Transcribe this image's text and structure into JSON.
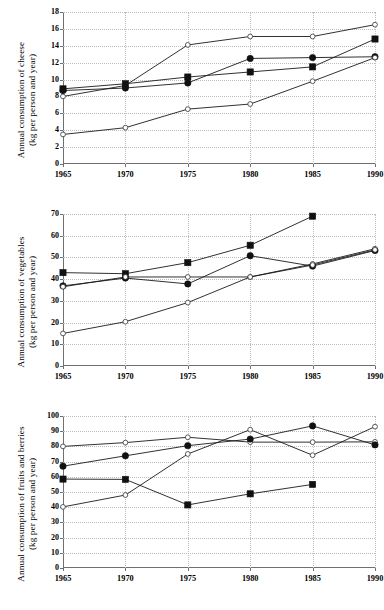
{
  "figure": {
    "panel_count": 3
  },
  "chart_data": [
    {
      "type": "line",
      "title": "",
      "ylabel": "Annual consumption of cheese\n(kg per person and year)",
      "xlabel": "",
      "x": [
        1965,
        1970,
        1975,
        1980,
        1985,
        1990
      ],
      "xticklabels": [
        "1965",
        "1970",
        "1975",
        "1980",
        "1985",
        "1990"
      ],
      "yticklabels": [
        "0",
        "2",
        "4",
        "6",
        "8",
        "10",
        "12",
        "14",
        "16",
        "18"
      ],
      "ylim": [
        0,
        18
      ],
      "ytick_step": 2,
      "xlim": [
        1965,
        1990
      ],
      "grid": true,
      "legend": "none",
      "series": [
        {
          "name": "series-open-circle-high",
          "marker": "open-circle",
          "values": [
            8.0,
            9.3,
            14.1,
            15.1,
            15.1,
            16.5
          ]
        },
        {
          "name": "series-filled-square",
          "marker": "filled-square",
          "values": [
            8.9,
            9.5,
            10.3,
            10.9,
            11.5,
            14.8
          ]
        },
        {
          "name": "series-filled-circle",
          "marker": "filled-circle",
          "values": [
            8.7,
            9.0,
            9.6,
            12.5,
            12.6,
            12.7
          ]
        },
        {
          "name": "series-open-circle-low",
          "marker": "open-circle",
          "values": [
            3.5,
            4.3,
            6.5,
            7.1,
            9.8,
            12.6
          ]
        }
      ]
    },
    {
      "type": "line",
      "title": "",
      "ylabel": "Annual consumption of vegetables\n(kg per person and year)",
      "xlabel": "",
      "x": [
        1965,
        1970,
        1975,
        1980,
        1985,
        1990
      ],
      "xticklabels": [
        "1965",
        "1970",
        "1975",
        "1980",
        "1985",
        "1990"
      ],
      "yticklabels": [
        "0",
        "10",
        "20",
        "30",
        "40",
        "50",
        "60",
        "70"
      ],
      "ylim": [
        0,
        70
      ],
      "ytick_step": 10,
      "xlim": [
        1965,
        1990
      ],
      "grid": true,
      "legend": "none",
      "series": [
        {
          "name": "series-filled-square",
          "marker": "filled-square",
          "values": [
            43.0,
            42.5,
            47.6,
            55.6,
            69.0,
            null
          ]
        },
        {
          "name": "series-filled-circle",
          "marker": "filled-circle",
          "values": [
            36.9,
            40.5,
            37.8,
            50.8,
            46.0,
            53.2
          ]
        },
        {
          "name": "series-open-circle-flat",
          "marker": "open-circle",
          "values": [
            36.5,
            41.0,
            41.0,
            41.0,
            47.0,
            54.0
          ]
        },
        {
          "name": "series-open-circle-low",
          "marker": "open-circle",
          "values": [
            15.0,
            20.4,
            29.2,
            41.0,
            46.5,
            53.5
          ]
        }
      ]
    },
    {
      "type": "line",
      "title": "",
      "ylabel": "Annual consumption of fruits and berries\n(kg per person and year)",
      "xlabel": "",
      "x": [
        1965,
        1970,
        1975,
        1980,
        1985,
        1990
      ],
      "xticklabels": [
        "1965",
        "1970",
        "1975",
        "1980",
        "1985",
        "1990"
      ],
      "yticklabels": [
        "0",
        "10",
        "20",
        "30",
        "40",
        "50",
        "60",
        "70",
        "80",
        "90",
        "100"
      ],
      "ylim": [
        0,
        100
      ],
      "ytick_step": 10,
      "xlim": [
        1965,
        1990
      ],
      "grid": true,
      "legend": "none",
      "series": [
        {
          "name": "series-open-circle-high",
          "marker": "open-circle",
          "values": [
            80.0,
            82.5,
            86.0,
            82.8,
            82.8,
            83.0
          ]
        },
        {
          "name": "series-filled-circle",
          "marker": "filled-circle",
          "values": [
            67.0,
            73.8,
            80.5,
            84.8,
            93.5,
            81.0
          ]
        },
        {
          "name": "series-open-circle-low",
          "marker": "open-circle",
          "values": [
            40.2,
            48.0,
            75.0,
            91.0,
            74.2,
            93.0
          ]
        },
        {
          "name": "series-filled-square",
          "marker": "filled-square",
          "values": [
            58.5,
            58.3,
            41.5,
            48.8,
            55.0,
            null
          ]
        }
      ]
    }
  ]
}
